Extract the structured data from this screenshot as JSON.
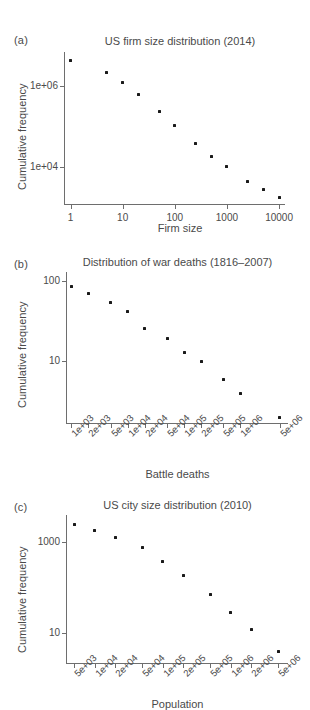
{
  "figure": {
    "background": "#ffffff",
    "point_color": "#1a1a1a",
    "axis_color": "#6e6e6e",
    "text_color": "#4a4a4a"
  },
  "panels": [
    {
      "tag": "(a)",
      "title": "US firm size distribution (2014)",
      "xlabel": "Firm size",
      "ylabel": "Cumulative frequency",
      "xticks": [
        "1",
        "10",
        "100",
        "1000",
        "10000"
      ],
      "yticks": [
        "1e+06",
        "1e+04"
      ]
    },
    {
      "tag": "(b)",
      "title": "Distribution of war deaths (1816–2007)",
      "xlabel": "Battle deaths",
      "ylabel": "Cumulative frequency",
      "xticks": [
        "1e+03",
        "2e+03",
        "5e+03",
        "1e+04",
        "2e+04",
        "5e+04",
        "1e+05",
        "2e+05",
        "5e+05",
        "1e+06",
        "5e+06"
      ],
      "yticks": [
        "100",
        "10"
      ]
    },
    {
      "tag": "(c)",
      "title": "US city size distribution (2010)",
      "xlabel": "Population",
      "ylabel": "Cumulative frequency",
      "xticks": [
        "5e+03",
        "1e+04",
        "2e+04",
        "5e+04",
        "1e+05",
        "2e+05",
        "5e+05",
        "1e+06",
        "2e+06",
        "5e+06"
      ],
      "yticks": [
        "1000",
        "10"
      ]
    }
  ],
  "chart_data": [
    {
      "type": "scatter",
      "panel": "(a)",
      "title": "US firm size distribution (2014)",
      "xlabel": "Firm size",
      "ylabel": "Cumulative frequency",
      "xscale": "log",
      "yscale": "log",
      "xlim": [
        0.75,
        13000
      ],
      "ylim": [
        1200,
        7000000
      ],
      "xtick_values": [
        1,
        10,
        100,
        1000,
        10000
      ],
      "xtick_labels": [
        "1",
        "10",
        "100",
        "1000",
        "10000"
      ],
      "ytick_values": [
        1000000,
        10000
      ],
      "ytick_labels": [
        "1e+06",
        "1e+04"
      ],
      "grid": false,
      "legend": "none",
      "x": [
        1,
        5,
        10,
        20,
        50,
        100,
        250,
        500,
        1000,
        2500,
        5000,
        10000
      ],
      "y": [
        4400000,
        2200000,
        1250000,
        620000,
        240000,
        105000,
        38000,
        18500,
        10200,
        4300,
        2700,
        1700
      ]
    },
    {
      "type": "scatter",
      "panel": "(b)",
      "title": "Distribution of war deaths (1816–2007)",
      "xlabel": "Battle deaths",
      "ylabel": "Cumulative frequency",
      "xscale": "log",
      "yscale": "log",
      "xlim": [
        800,
        7000000
      ],
      "ylim": [
        1.7,
        130
      ],
      "xtick_values": [
        1000,
        2000,
        5000,
        10000,
        20000,
        50000,
        100000,
        200000,
        500000,
        1000000,
        5000000
      ],
      "xtick_labels": [
        "1e+03",
        "2e+03",
        "5e+03",
        "1e+04",
        "2e+04",
        "5e+04",
        "1e+05",
        "2e+05",
        "5e+05",
        "1e+06",
        "5e+06"
      ],
      "ytick_values": [
        100,
        10
      ],
      "ytick_labels": [
        "100",
        "10"
      ],
      "grid": false,
      "legend": "none",
      "x": [
        1000,
        2000,
        5000,
        10000,
        20000,
        50000,
        100000,
        200000,
        500000,
        1000000,
        5000000
      ],
      "y": [
        85,
        70,
        54,
        42,
        26,
        19,
        13,
        10,
        6,
        4,
        2
      ]
    },
    {
      "type": "scatter",
      "panel": "(c)",
      "title": "US city size distribution (2010)",
      "xlabel": "Population",
      "ylabel": "Cumulative frequency",
      "xscale": "log",
      "yscale": "log",
      "xlim": [
        3800,
        7000000
      ],
      "ylim": [
        2.2,
        4000
      ],
      "xtick_values": [
        5000,
        10000,
        20000,
        50000,
        100000,
        200000,
        500000,
        1000000,
        2000000,
        5000000
      ],
      "xtick_labels": [
        "5e+03",
        "1e+04",
        "2e+04",
        "5e+04",
        "1e+05",
        "2e+05",
        "5e+05",
        "1e+06",
        "2e+06",
        "5e+06"
      ],
      "ytick_values": [
        1000,
        10
      ],
      "ytick_labels": [
        "1000",
        "10"
      ],
      "grid": false,
      "legend": "none",
      "x": [
        5000,
        10000,
        20000,
        50000,
        100000,
        200000,
        500000,
        1000000,
        2000000,
        5000000
      ],
      "y": [
        2500,
        1850,
        1300,
        760,
        380,
        190,
        72,
        28,
        12,
        4
      ]
    }
  ]
}
